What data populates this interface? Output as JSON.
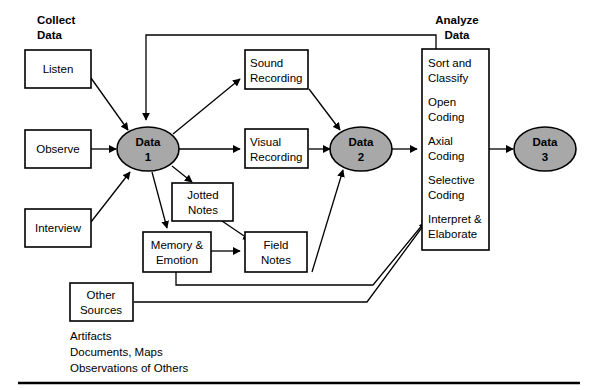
{
  "figure": {
    "title_collect": {
      "line1": "Collect",
      "line2": "Data"
    },
    "title_analyze": {
      "line1": "Analyze",
      "line2": "Data"
    }
  },
  "colors": {
    "node_fill": "#a8a8a8",
    "box_fill": "#ffffff",
    "stroke": "#000000",
    "background": "#ffffff"
  },
  "collect_inputs": [
    {
      "id": "listen",
      "label": "Listen"
    },
    {
      "id": "observe",
      "label": "Observe"
    },
    {
      "id": "interview",
      "label": "Interview"
    }
  ],
  "data_nodes": [
    {
      "id": "data1",
      "line1": "Data",
      "line2": "1"
    },
    {
      "id": "data2",
      "line1": "Data",
      "line2": "2"
    },
    {
      "id": "data3",
      "line1": "Data",
      "line2": "3"
    }
  ],
  "record_boxes": [
    {
      "id": "sound-recording",
      "line1": "Sound",
      "line2": "Recording"
    },
    {
      "id": "visual-recording",
      "line1": "Visual",
      "line2": "Recording"
    },
    {
      "id": "jotted-notes",
      "line1": "Jotted",
      "line2": "Notes"
    },
    {
      "id": "memory-emotion",
      "line1": "Memory &",
      "line2": "Emotion"
    },
    {
      "id": "field-notes",
      "line1": "Field",
      "line2": "Notes"
    },
    {
      "id": "other-sources",
      "line1": "Other",
      "line2": "Sources"
    }
  ],
  "analyze_steps": [
    {
      "id": "sort-and-classify",
      "line1": "Sort and",
      "line2": "Classify"
    },
    {
      "id": "open-coding",
      "line1": "Open",
      "line2": "Coding"
    },
    {
      "id": "axial-coding",
      "line1": "Axial",
      "line2": "Coding"
    },
    {
      "id": "selective-coding",
      "line1": "Selective",
      "line2": "Coding"
    },
    {
      "id": "interpret-elaborate",
      "line1": "Interpret &",
      "line2": "Elaborate"
    }
  ],
  "other_sources_list": [
    "Artifacts",
    "Documents, Maps",
    "Observations of Others"
  ]
}
